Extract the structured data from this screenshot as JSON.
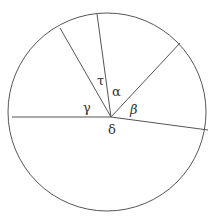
{
  "diagram": {
    "type": "circle-sectors",
    "stroke_color": "#555555",
    "circle": {
      "cx": 107,
      "cy": 112,
      "r": 99
    },
    "center_point": {
      "x": 111,
      "y": 117
    },
    "rays": [
      {
        "x": 12,
        "y": 117
      },
      {
        "x": 60,
        "y": 28
      },
      {
        "x": 97,
        "y": 14
      },
      {
        "x": 180,
        "y": 43
      },
      {
        "x": 208,
        "y": 130
      }
    ],
    "labels": {
      "tau": {
        "text": "τ",
        "x": 97,
        "y": 85
      },
      "alpha": {
        "text": "α",
        "x": 112,
        "y": 96
      },
      "gamma": {
        "text": "γ",
        "x": 83,
        "y": 112
      },
      "beta": {
        "text": "β",
        "x": 130,
        "y": 114
      },
      "delta": {
        "text": "δ",
        "x": 108,
        "y": 134
      }
    }
  }
}
